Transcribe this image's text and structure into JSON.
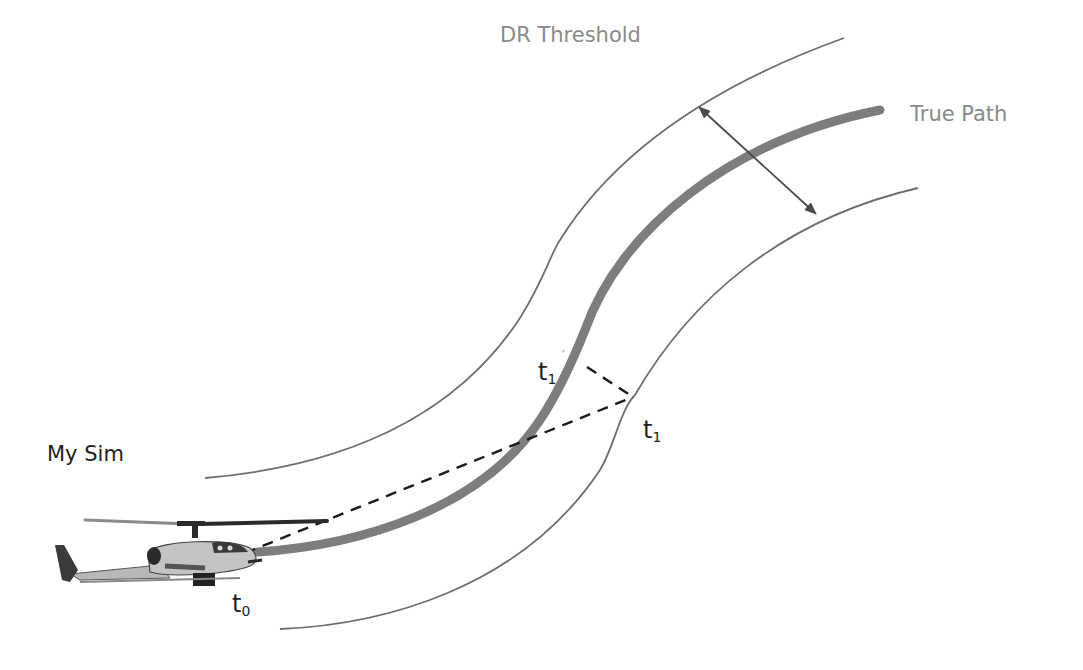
{
  "diagram": {
    "labels": {
      "dr_threshold": "DR Threshold",
      "true_path": "True Path",
      "my_sim": "My Sim",
      "t0_base": "t",
      "t0_sub": "0",
      "t1_prime_base": "t",
      "t1_prime_sub": "1",
      "t1_prime_mark": "′",
      "t1_base": "t",
      "t1_sub": "1"
    },
    "icons": {
      "vehicle": "helicopter-icon",
      "threshold_width": "double-arrow-icon"
    },
    "colors": {
      "background": "#ffffff",
      "true_path": "#7d7d7d",
      "threshold_line": "#6e6e6e",
      "dashed_line": "#1a1a1a",
      "label_gray": "#8a8a8a",
      "label_dark": "#1e1e1e",
      "arrow": "#4a4a4a"
    }
  }
}
